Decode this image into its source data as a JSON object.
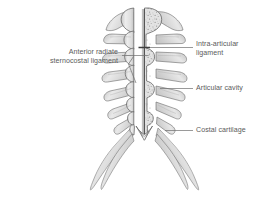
{
  "figure": {
    "background_color": "#ffffff",
    "label_color": "#5b5b5b",
    "leader_color": "#6e6e6e",
    "outline_color": "#5a5a5a",
    "bone_light": "#f2f2f2",
    "bone_mid": "#d8d8d8",
    "bone_dark": "#b4b4b4",
    "cancellous_color": "#9a9a9a",
    "midline_color": "#4a4a4a"
  },
  "labels": {
    "anterior_radiate": {
      "text": "Anterior radiate\nsternocostal ligament",
      "side": "left"
    },
    "intra_articular": {
      "text": "Intra-articular\nligament",
      "side": "right"
    },
    "articular_cavity": {
      "text": "Articular cavity",
      "side": "right"
    },
    "costal_cartilage": {
      "text": "Costal cartilage",
      "side": "right"
    }
  }
}
